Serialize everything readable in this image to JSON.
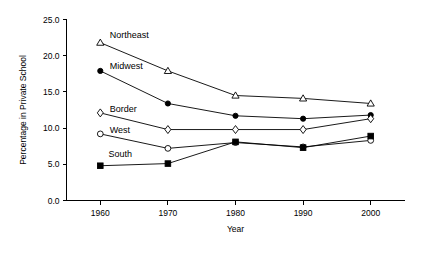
{
  "chart_data": {
    "type": "line",
    "title": "",
    "subtitle": "",
    "xlabel": "Year",
    "ylabel": "Percentage in Private School",
    "x": [
      1960,
      1970,
      1980,
      1990,
      2000
    ],
    "categories": [
      "1960",
      "1970",
      "1980",
      "1990",
      "2000"
    ],
    "xlim": [
      1955,
      2005
    ],
    "ylim": [
      0.0,
      25.0
    ],
    "xticks": [
      "1960",
      "1970",
      "1980",
      "1990",
      "2000"
    ],
    "yticks": [
      "0.0",
      "5.0",
      "10.0",
      "15.0",
      "20.0",
      "25.0"
    ],
    "ytick_values": [
      0.0,
      5.0,
      10.0,
      15.0,
      20.0,
      25.0
    ],
    "grid": false,
    "legend_position": "inline-annotations",
    "series": [
      {
        "name": "Northeast",
        "marker": "open-triangle",
        "values": [
          21.8,
          17.9,
          14.5,
          14.1,
          13.4
        ],
        "label_x": 1961.4,
        "label_y": 22.8
      },
      {
        "name": "Midwest",
        "marker": "filled-circle",
        "values": [
          17.9,
          13.4,
          11.7,
          11.3,
          11.8
        ],
        "label_x": 1961.4,
        "label_y": 18.6
      },
      {
        "name": "Border",
        "marker": "open-diamond",
        "values": [
          12.1,
          9.8,
          9.8,
          9.8,
          11.3
        ],
        "label_x": 1961.4,
        "label_y": 12.7
      },
      {
        "name": "West",
        "marker": "open-circle",
        "values": [
          9.2,
          7.2,
          8.0,
          7.4,
          8.3
        ],
        "label_x": 1961.4,
        "label_y": 9.7
      },
      {
        "name": "South",
        "marker": "filled-square",
        "values": [
          4.8,
          5.1,
          8.1,
          7.3,
          8.9
        ],
        "label_x": 1961.2,
        "label_y": 6.4
      }
    ]
  },
  "axes": {
    "x_title": "Year",
    "y_title": "Percentage in Private School"
  }
}
